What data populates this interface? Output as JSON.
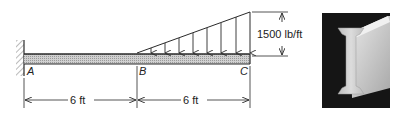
{
  "figure": {
    "beam": {
      "support_A": "fixed",
      "points": [
        {
          "id": "A",
          "label": "A"
        },
        {
          "id": "B",
          "label": "B"
        },
        {
          "id": "C",
          "label": "C"
        }
      ]
    },
    "load": {
      "type": "linearly varying distributed load",
      "from": "B",
      "to": "C",
      "max_intensity_label": "1500 lb/ft"
    },
    "dimensions": [
      {
        "from": "A",
        "to": "B",
        "label": "6 ft"
      },
      {
        "from": "B",
        "to": "C",
        "label": "6 ft"
      }
    ],
    "photo": {
      "subject": "steel I-beam cross-section"
    }
  },
  "colors": {
    "line": "#2a2a2a",
    "beam_fill": "#c8c8c8",
    "photo_bg": "#151515",
    "photo_beam": "#d4d4d4"
  }
}
